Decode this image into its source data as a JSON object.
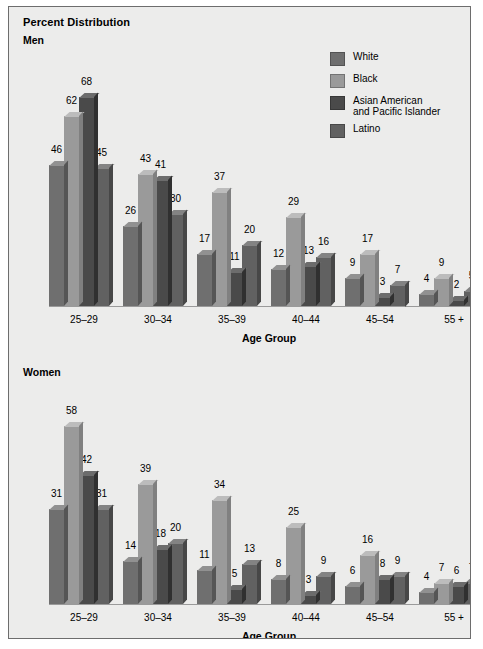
{
  "figure": {
    "title": "Percent Distribution",
    "axis_title": "Age Group",
    "background": "#ececeb",
    "border_color": "#6d6d6d"
  },
  "legend": {
    "position": "top-right",
    "items": [
      {
        "label": "White",
        "color": "#6f6f6f"
      },
      {
        "label": "Black",
        "color": "#9a9a9a"
      },
      {
        "label": "Asian American\nand Pacific Islander",
        "line1": "Asian American",
        "line2": "and Pacific Islander",
        "color": "#4a4a4a"
      },
      {
        "label": "Latino",
        "color": "#616161"
      }
    ]
  },
  "panels": [
    {
      "key": "men",
      "label": "Men"
    },
    {
      "key": "women",
      "label": "Women"
    }
  ],
  "chart_data": {
    "type": "bar",
    "title": "Percent Distribution",
    "xlabel": "Age Group",
    "ylabel": "",
    "ylim": [
      0,
      70
    ],
    "grid": false,
    "legend_position": "top-right",
    "categories": [
      "25–29",
      "30–34",
      "35–39",
      "40–44",
      "45–54",
      "55 +"
    ],
    "panels": [
      {
        "name": "Men",
        "series": [
          {
            "name": "White",
            "color": "#6f6f6f",
            "values": [
              46,
              26,
              17,
              12,
              9,
              4
            ]
          },
          {
            "name": "Black",
            "color": "#9a9a9a",
            "values": [
              62,
              43,
              37,
              29,
              17,
              9
            ]
          },
          {
            "name": "Asian American and Pacific Islander",
            "color": "#4a4a4a",
            "values": [
              68,
              41,
              11,
              13,
              3,
              2
            ]
          },
          {
            "name": "Latino",
            "color": "#616161",
            "values": [
              45,
              30,
              20,
              16,
              7,
              5
            ]
          }
        ]
      },
      {
        "name": "Women",
        "series": [
          {
            "name": "White",
            "color": "#6f6f6f",
            "values": [
              31,
              14,
              11,
              8,
              6,
              4
            ]
          },
          {
            "name": "Black",
            "color": "#9a9a9a",
            "values": [
              58,
              39,
              34,
              25,
              16,
              7
            ]
          },
          {
            "name": "Asian American and Pacific Islander",
            "color": "#4a4a4a",
            "values": [
              42,
              18,
              5,
              3,
              8,
              6
            ]
          },
          {
            "name": "Latino",
            "color": "#616161",
            "values": [
              31,
              20,
              13,
              9,
              9,
              7
            ]
          }
        ]
      }
    ]
  }
}
